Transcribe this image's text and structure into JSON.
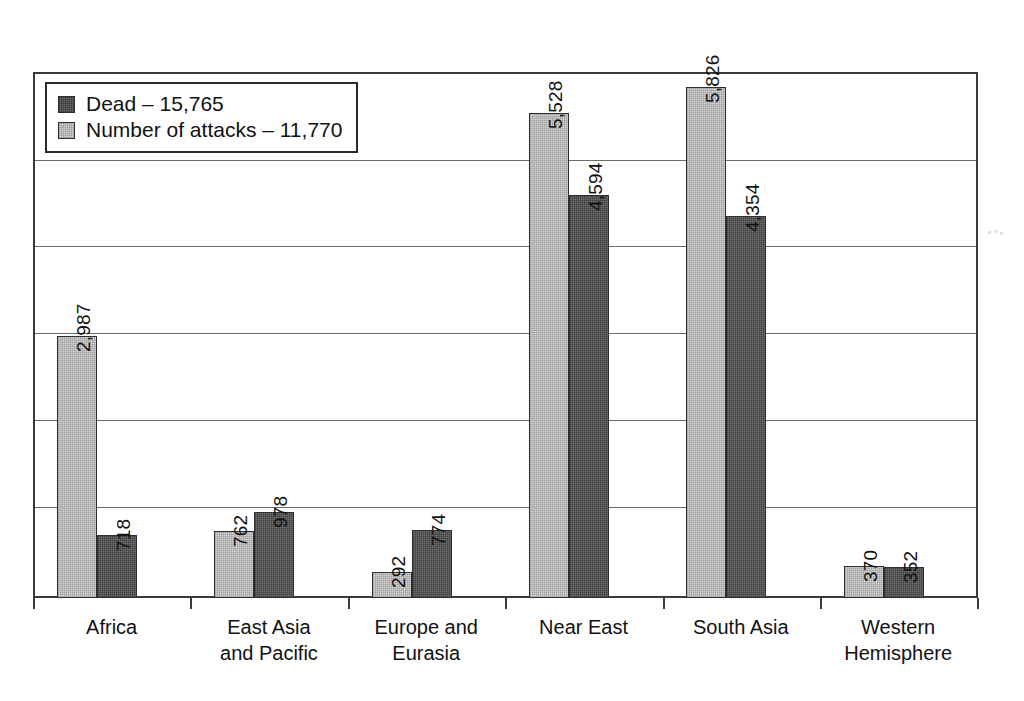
{
  "chart_data": {
    "type": "bar",
    "title": "",
    "xlabel": "",
    "ylabel": "",
    "ylim": [
      0,
      6000
    ],
    "grid": true,
    "gridline_values": [
      1000,
      2000,
      3000,
      4000,
      5000,
      6000
    ],
    "legend_position": "top-left",
    "categories": [
      "Africa",
      "East Asia\nand Pacific",
      "Europe and\nEurasia",
      "Near East",
      "South Asia",
      "Western\nHemisphere"
    ],
    "series": [
      {
        "name": "Number of attacks",
        "total": 11770,
        "legend_label": "Number of attacks – 11,770",
        "color": "#d2d2d2",
        "values": [
          2987,
          762,
          292,
          5528,
          5826,
          370
        ],
        "value_labels": [
          "2,987",
          "762",
          "292",
          "5,528",
          "5,826",
          "370"
        ]
      },
      {
        "name": "Dead",
        "total": 15765,
        "legend_label": "Dead – 15,765",
        "color": "#6e6e6e",
        "values": [
          718,
          978,
          774,
          4594,
          4354,
          352
        ],
        "value_labels": [
          "718",
          "978",
          "774",
          "4,594",
          "4,354",
          "352"
        ]
      }
    ]
  },
  "legend": {
    "items": [
      {
        "label": "Dead – 15,765",
        "swatch": "dark"
      },
      {
        "label": "Number of attacks – 11,770",
        "swatch": "light"
      }
    ]
  }
}
